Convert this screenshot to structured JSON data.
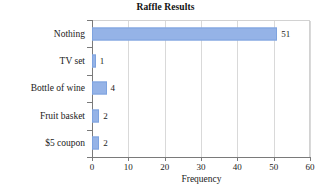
{
  "chart_data": {
    "type": "bar",
    "orientation": "horizontal",
    "title": "Raffle Results",
    "xlabel": "Frequency",
    "ylabel": "",
    "categories": [
      "Nothing",
      "TV set",
      "Bottle of wine",
      "Fruit basket",
      "$5 coupon"
    ],
    "values": [
      51,
      1,
      4,
      2,
      2
    ],
    "value_labels": [
      "51",
      "1",
      "4",
      "2",
      "2"
    ],
    "xlim": [
      0,
      60
    ],
    "xticks": [
      0,
      10,
      20,
      30,
      40,
      50,
      60
    ],
    "xtick_labels": [
      "0",
      "10",
      "20",
      "30",
      "40",
      "50",
      "60"
    ],
    "grid": "vertical",
    "legend": "none",
    "bar_color": "#95b3e7",
    "bar_edge_color": "#7ea3df",
    "grid_color": "#d9d9d9",
    "axis_color": "#7a7a7a",
    "background": "#ffffff"
  }
}
